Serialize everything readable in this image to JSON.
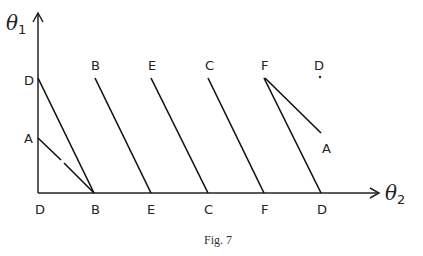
{
  "figure": {
    "caption": "Fig. 7",
    "axes": {
      "y_label": "θ",
      "y_sub": "1",
      "x_label": "θ",
      "x_sub": "2"
    },
    "top_labels": [
      "B",
      "E",
      "C",
      "F",
      "D"
    ],
    "left_labels": [
      "D",
      "A"
    ],
    "bottom_labels": [
      "D",
      "B",
      "E",
      "C",
      "F",
      "D"
    ],
    "right_end_label": "A"
  }
}
